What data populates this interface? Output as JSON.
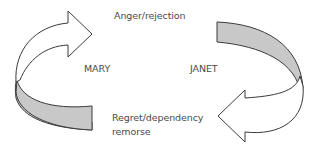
{
  "diagram": {
    "type": "cycle",
    "participants": {
      "left": "MARY",
      "right": "JANET"
    },
    "stages": {
      "top": "Anger/rejection",
      "bottom_line1": "Regret/dependency",
      "bottom_line2": "remorse"
    },
    "colors": {
      "arrow_fill": "#ffffff",
      "band_fill": "#c8c8c8",
      "stroke": "#3a3a3a",
      "text": "#4a4a4a"
    }
  }
}
